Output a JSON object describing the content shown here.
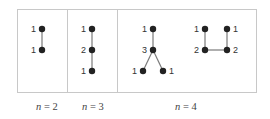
{
  "panels": [
    {
      "caption_var": "n",
      "caption_rest": " = 2",
      "trees": [
        {
          "nodes": [
            {
              "id": "a",
              "label": "1"
            },
            {
              "id": "b",
              "label": "1"
            }
          ],
          "edges": [
            [
              "a",
              "b"
            ]
          ]
        }
      ]
    },
    {
      "caption_var": "n",
      "caption_rest": " = 3",
      "trees": [
        {
          "nodes": [
            {
              "id": "a",
              "label": "1"
            },
            {
              "id": "b",
              "label": "2"
            },
            {
              "id": "c",
              "label": "1"
            }
          ],
          "edges": [
            [
              "a",
              "b"
            ],
            [
              "b",
              "c"
            ]
          ]
        }
      ]
    },
    {
      "caption_var": "n",
      "caption_rest": " = 4",
      "trees": [
        {
          "nodes": [
            {
              "id": "a",
              "label": "1"
            },
            {
              "id": "b",
              "label": "3"
            },
            {
              "id": "c",
              "label": "1"
            },
            {
              "id": "d",
              "label": "1"
            }
          ],
          "edges": [
            [
              "a",
              "b"
            ],
            [
              "b",
              "c"
            ],
            [
              "b",
              "d"
            ]
          ]
        },
        {
          "nodes": [
            {
              "id": "a",
              "label": "1"
            },
            {
              "id": "b",
              "label": "2"
            },
            {
              "id": "c",
              "label": "2"
            },
            {
              "id": "d",
              "label": "1"
            }
          ],
          "edges": [
            [
              "a",
              "b"
            ],
            [
              "b",
              "c"
            ],
            [
              "c",
              "d"
            ]
          ]
        }
      ]
    }
  ],
  "colors": {
    "node": "#222222",
    "edge": "#7a7a7a",
    "frame": "#c8c8c8"
  }
}
